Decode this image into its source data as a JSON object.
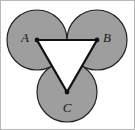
{
  "figure": {
    "canvas": {
      "width": 135,
      "height": 130,
      "background": "#ffffff"
    },
    "frame": {
      "visible": true,
      "color": "#b8b8b8",
      "stroke_width": 1,
      "x": 0.5,
      "y": 0.5,
      "width": 134,
      "height": 129
    },
    "style": {
      "circle_fill": "#9e9e9e",
      "circle_stroke": "#222222",
      "circle_stroke_width": 1.2,
      "triangle_fill": "#ffffff",
      "triangle_stroke": "#111111",
      "triangle_stroke_width": 2.2,
      "vertex_dot_color": "#111111",
      "vertex_dot_radius": 2.4,
      "label_color": "#1a1a1a",
      "label_font_size": 13
    },
    "circles": [
      {
        "name": "circle-a",
        "cx": 37,
        "cy": 40,
        "r": 30
      },
      {
        "name": "circle-b",
        "cx": 97,
        "cy": 40,
        "r": 30
      },
      {
        "name": "circle-c",
        "cx": 67,
        "cy": 92,
        "r": 30
      }
    ],
    "triangle": {
      "points": "37,40 97,40 67,92",
      "orientation": "inverted"
    },
    "vertices": [
      {
        "name": "vertex-a",
        "label": "A",
        "cx": 37,
        "cy": 40,
        "label_x": 25,
        "label_y": 42
      },
      {
        "name": "vertex-b",
        "label": "B",
        "cx": 97,
        "cy": 40,
        "label_x": 103,
        "label_y": 42
      },
      {
        "name": "vertex-c",
        "label": "C",
        "cx": 67,
        "cy": 92,
        "label_x": 64,
        "label_y": 110
      }
    ]
  }
}
